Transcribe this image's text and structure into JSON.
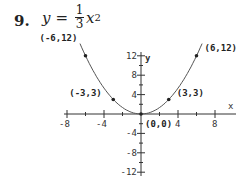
{
  "problem": {
    "number": "9.",
    "equation": {
      "lhs": "y",
      "equals": "=",
      "numerator": "1",
      "denominator": "3",
      "var": "x",
      "exponent": "2"
    }
  },
  "chart_data": {
    "type": "line",
    "xlabel": "x",
    "ylabel": "y",
    "xlim": [
      -9,
      10
    ],
    "ylim": [
      -12,
      13
    ],
    "x_ticks": [
      "-8",
      "-4",
      "4",
      "8"
    ],
    "y_ticks": [
      "12",
      "8",
      "4",
      "-4",
      "-8",
      "-12"
    ],
    "grid": false,
    "series": [
      {
        "name": "y = x^2/3",
        "x": [
          -6,
          -5,
          -4,
          -3,
          -2,
          -1,
          0,
          1,
          2,
          3,
          4,
          5,
          6
        ],
        "y": [
          12,
          8.33,
          5.33,
          3,
          1.33,
          0.33,
          0,
          0.33,
          1.33,
          3,
          5.33,
          8.33,
          12
        ]
      }
    ],
    "points": [
      {
        "x": -6,
        "y": 12,
        "label": "(-6,12)"
      },
      {
        "x": -3,
        "y": 3,
        "label": "(-3,3)"
      },
      {
        "x": 0,
        "y": 0,
        "label": "(0,0)"
      },
      {
        "x": 3,
        "y": 3,
        "label": "(3,3)"
      },
      {
        "x": 6,
        "y": 12,
        "label": "(6,12)"
      }
    ]
  }
}
